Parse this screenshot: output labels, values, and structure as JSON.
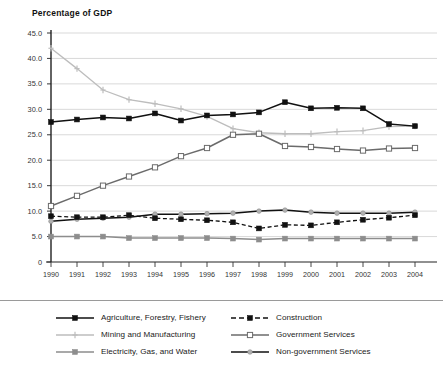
{
  "chart_data": {
    "type": "line",
    "title": "Percentage of GDP",
    "xlabel": "",
    "ylabel": "",
    "ylim": [
      0,
      45
    ],
    "ytick_labels": [
      "0",
      "5.0",
      "10.0",
      "15.0",
      "20.0",
      "25.0",
      "30.0",
      "35.0",
      "40.0",
      "45.0"
    ],
    "ytick_values": [
      0,
      5,
      10,
      15,
      20,
      25,
      30,
      35,
      40,
      45
    ],
    "grid": "horizontal",
    "legend_position": "bottom",
    "categories": [
      "1990",
      "1991",
      "1992",
      "1993",
      "1994",
      "1995",
      "1996",
      "1997",
      "1998",
      "1999",
      "2000",
      "2001",
      "2002",
      "2003",
      "2004"
    ],
    "series": [
      {
        "name": "Agriculture, Forestry, Fishery",
        "color": "#111111",
        "style": "solid",
        "marker": "square-filled",
        "values": [
          27.5,
          28.0,
          28.4,
          28.2,
          29.2,
          27.8,
          28.8,
          29.0,
          29.4,
          31.4,
          30.2,
          30.3,
          30.2,
          27.1,
          26.7
        ]
      },
      {
        "name": "Mining and Manufacturing",
        "color": "#bdbdbd",
        "style": "solid",
        "marker": "plus",
        "values": [
          42.0,
          38.0,
          33.8,
          31.9,
          31.1,
          30.1,
          28.6,
          26.2,
          25.4,
          25.2,
          25.2,
          25.6,
          25.8,
          26.6,
          26.7
        ]
      },
      {
        "name": "Electricity, Gas, and Water",
        "color": "#8d8d8d",
        "style": "solid",
        "marker": "square-filled",
        "values": [
          5.0,
          5.0,
          5.0,
          4.7,
          4.7,
          4.7,
          4.7,
          4.6,
          4.4,
          4.6,
          4.6,
          4.6,
          4.6,
          4.6,
          4.6
        ]
      },
      {
        "name": "Construction",
        "color": "#111111",
        "style": "dashed",
        "marker": "square-filled",
        "values": [
          9.0,
          8.8,
          8.8,
          9.2,
          8.6,
          8.4,
          8.2,
          7.8,
          6.6,
          7.3,
          7.2,
          7.8,
          8.3,
          8.7,
          9.2
        ]
      },
      {
        "name": "Government Services",
        "color": "#6b6b6b",
        "style": "solid",
        "marker": "square-open",
        "values": [
          11.0,
          13.0,
          15.0,
          16.8,
          18.6,
          20.8,
          22.4,
          25.0,
          25.2,
          22.8,
          22.6,
          22.2,
          21.9,
          22.3,
          22.4
        ]
      },
      {
        "name": "Non-government Services",
        "color": "#111111",
        "style": "solid-dotcenter",
        "marker": "circle-grey",
        "values": [
          8.0,
          8.4,
          8.6,
          8.8,
          9.4,
          9.4,
          9.5,
          9.6,
          10.0,
          10.2,
          9.8,
          9.6,
          9.6,
          9.6,
          9.8
        ]
      }
    ]
  },
  "legend": {
    "items": [
      {
        "label": "Agriculture, Forestry, Fishery",
        "key": "agriculture"
      },
      {
        "label": "Construction",
        "key": "construction"
      },
      {
        "label": "Mining and Manufacturing",
        "key": "mining"
      },
      {
        "label": "Government Services",
        "key": "government"
      },
      {
        "label": "Electricity, Gas, and Water",
        "key": "electricity"
      },
      {
        "label": "Non-government Services",
        "key": "nongovernment"
      }
    ]
  }
}
